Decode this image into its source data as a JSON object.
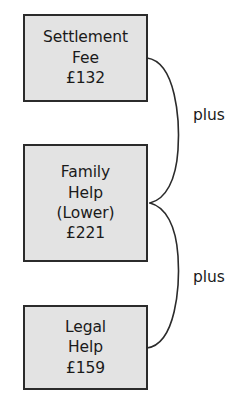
{
  "diagram": {
    "type": "bracket-sum-diagram",
    "colors": {
      "box_fill": "#e3e3e3",
      "box_border": "#2b2b2b",
      "text": "#1a1a1a",
      "connector": "#2b2b2b",
      "background": "#ffffff"
    },
    "boxes": [
      {
        "id": "settlement-fee",
        "lines": [
          "Settlement",
          "Fee",
          "£132"
        ],
        "label": "Settlement Fee",
        "amount": "£132"
      },
      {
        "id": "family-help",
        "lines": [
          "Family",
          "Help",
          "(Lower)",
          "£221"
        ],
        "label": "Family Help (Lower)",
        "amount": "£221"
      },
      {
        "id": "legal-help",
        "lines": [
          "Legal",
          "Help",
          "£159"
        ],
        "label": "Legal Help",
        "amount": "£159"
      }
    ],
    "connectors": [
      {
        "id": "plus-upper",
        "label": "plus",
        "from": "settlement-fee",
        "to": "family-help"
      },
      {
        "id": "plus-lower",
        "label": "plus",
        "from": "family-help",
        "to": "legal-help"
      }
    ]
  }
}
